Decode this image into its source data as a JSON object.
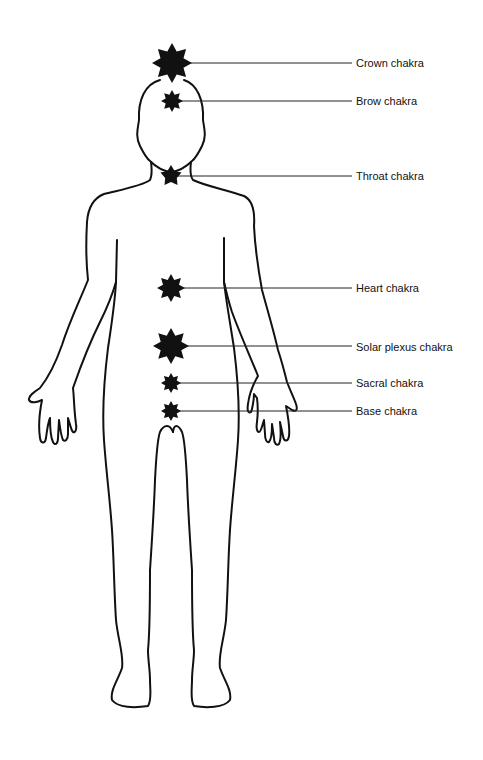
{
  "diagram": {
    "colors": {
      "ink": "#111111",
      "background": "#ffffff"
    },
    "chakras": [
      {
        "id": "crown",
        "label": "Crown chakra",
        "cx": 172,
        "cy": 63,
        "r": 20,
        "points": 8,
        "line_end": 352,
        "label_x": 356,
        "label_y": 57
      },
      {
        "id": "brow",
        "label": "Brow chakra",
        "cx": 172,
        "cy": 101,
        "r": 11,
        "points": 8,
        "line_end": 352,
        "label_x": 356,
        "label_y": 95
      },
      {
        "id": "throat",
        "label": "Throat chakra",
        "cx": 171,
        "cy": 176,
        "r": 11,
        "points": 5,
        "line_end": 352,
        "label_x": 356,
        "label_y": 170
      },
      {
        "id": "heart",
        "label": "Heart chakra",
        "cx": 171,
        "cy": 288,
        "r": 14,
        "points": 8,
        "line_end": 352,
        "label_x": 356,
        "label_y": 282
      },
      {
        "id": "solar-plexus",
        "label": "Solar plexus chakra",
        "cx": 171,
        "cy": 346,
        "r": 18,
        "points": 8,
        "line_end": 352,
        "label_x": 356,
        "label_y": 341
      },
      {
        "id": "sacral",
        "label": "Sacral chakra",
        "cx": 171,
        "cy": 383,
        "r": 10,
        "points": 8,
        "line_end": 352,
        "label_x": 356,
        "label_y": 377
      },
      {
        "id": "base",
        "label": "Base chakra",
        "cx": 171,
        "cy": 411,
        "r": 10,
        "points": 8,
        "line_end": 352,
        "label_x": 356,
        "label_y": 405
      }
    ]
  }
}
